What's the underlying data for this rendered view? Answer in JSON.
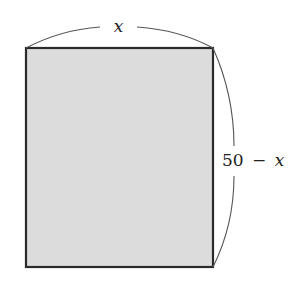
{
  "diagram": {
    "type": "rectangle-with-dimension-arcs",
    "rectangle": {
      "x": 26,
      "y": 48,
      "width": 187,
      "height": 219,
      "fill": "#dcdcdc",
      "stroke": "#2a2a2a"
    },
    "width_label": {
      "text": "x",
      "variable": "x"
    },
    "height_label": {
      "number": "50",
      "operator": "−",
      "variable": "x",
      "text": "50 − x"
    },
    "arc_color": "#555555"
  }
}
